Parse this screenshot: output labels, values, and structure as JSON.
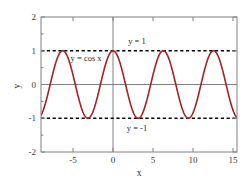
{
  "chart_data": {
    "type": "line",
    "title": "",
    "xlabel": "x",
    "ylabel": "y",
    "xlim": [
      -9.0,
      15.5
    ],
    "ylim": [
      -2,
      2
    ],
    "xticks": [
      -5,
      0,
      5,
      10,
      15
    ],
    "xtick_labels": [
      "-5",
      "0",
      "5",
      "10",
      "15"
    ],
    "yticks": [
      -2,
      -1,
      0,
      1,
      2
    ],
    "ytick_labels": [
      "-2",
      "-1",
      "0",
      "1",
      "2"
    ],
    "grid": false,
    "legend": "none",
    "series": [
      {
        "name": "y = cos x",
        "kind": "curve",
        "expression": "cos(x)",
        "color": "#a62121",
        "linewidth": 1.6,
        "linestyle": "solid",
        "amplitude": 1,
        "period": 6.283185307179586,
        "maxima_x": [
          -6.283185307179586,
          0,
          6.283185307179586,
          12.566370614359172
        ],
        "minima_x": [
          -9.42477796076938,
          -3.141592653589793,
          3.141592653589793,
          9.42477796076938,
          15.707963267948966
        ]
      },
      {
        "name": "y = 1",
        "kind": "horizontal-line",
        "value": 1,
        "color": "#000000",
        "linestyle": "dashed",
        "linewidth": 1.6
      },
      {
        "name": "y = -1",
        "kind": "horizontal-line",
        "value": -1,
        "color": "#000000",
        "linestyle": "dashed",
        "linewidth": 1.6
      }
    ],
    "zero_lines": {
      "x_axis_line": 0,
      "y_axis_line": 0,
      "color": "#808080"
    },
    "annotations": [
      {
        "id": "upper-bound",
        "text": "y = 1",
        "x": 3.0,
        "y": 1.3,
        "anchor": "middle"
      },
      {
        "id": "cosine-curve",
        "text": "y = cos x",
        "x": -5.3,
        "y": 0.78,
        "anchor": "start"
      },
      {
        "id": "lower-bound",
        "text": "y = -1",
        "x": 3.0,
        "y": -1.3,
        "anchor": "middle"
      }
    ],
    "frame": {
      "color": "#808080",
      "linewidth": 1
    }
  },
  "figure": {
    "background": "#ffffff",
    "axis_color": "#808080",
    "text_color": "#2b2b2b"
  }
}
